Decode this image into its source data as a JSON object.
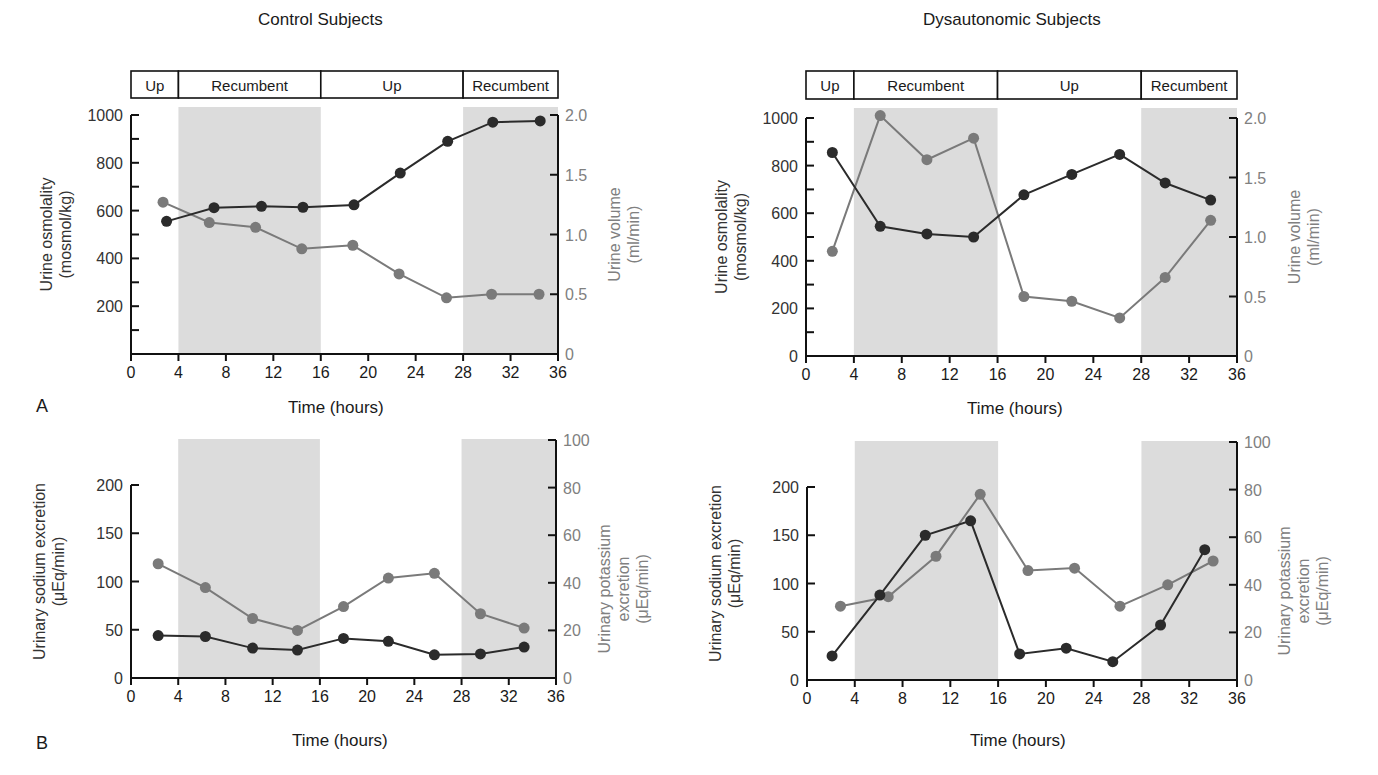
{
  "figure": {
    "panel_letters": [
      "A",
      "B"
    ],
    "column_titles": [
      "Control Subjects",
      "Dysautonomic Subjects"
    ],
    "posture_bar": [
      {
        "label": "Up",
        "from": 0,
        "to": 4
      },
      {
        "label": "Recumbent",
        "from": 4,
        "to": 16
      },
      {
        "label": "Up",
        "from": 16,
        "to": 28
      },
      {
        "label": "Recumbent",
        "from": 28,
        "to": 36
      }
    ],
    "shaded_intervals": [
      [
        4,
        16
      ],
      [
        28,
        36
      ]
    ],
    "colors": {
      "dark_series": "#2b2b2b",
      "gray_series": "#7a7a7a",
      "shade": "#dcdcdc",
      "axis": "#111111",
      "right_axis_text": "#808080"
    }
  },
  "chart_data": [
    {
      "id": "A-control",
      "type": "line",
      "title": "Control Subjects",
      "xlabel": "Time (hours)",
      "ylabel": "Urine osmolality (mosmol/kg)",
      "ylabel_right": "Urine volume (ml/min)",
      "xlim": [
        0,
        36
      ],
      "xticks": [
        0,
        4,
        8,
        12,
        16,
        20,
        24,
        28,
        32,
        36
      ],
      "ylim": [
        0,
        1000
      ],
      "yticks_labeled": [
        200,
        400,
        600,
        800,
        1000
      ],
      "yticks_minor": [
        100,
        300,
        500,
        700,
        900
      ],
      "ylim_right": [
        0,
        2.0
      ],
      "yticks_right": [
        "0",
        "0.5",
        "1.0",
        "1.5",
        "2.0"
      ],
      "grid": false,
      "series": [
        {
          "name": "Urine osmolality",
          "axis": "left",
          "color": "dark",
          "x": [
            3,
            7,
            11,
            14.5,
            18.8,
            22.7,
            26.7,
            30.5,
            34.5
          ],
          "values": [
            555,
            612,
            618,
            614,
            624,
            757,
            890,
            970,
            975
          ]
        },
        {
          "name": "Urine volume",
          "axis": "right",
          "color": "gray",
          "x": [
            2.7,
            6.6,
            10.5,
            14.4,
            18.7,
            22.6,
            26.6,
            30.4,
            34.4
          ],
          "values": [
            1.27,
            1.1,
            1.06,
            0.88,
            0.91,
            0.67,
            0.47,
            0.5,
            0.5
          ]
        }
      ]
    },
    {
      "id": "A-dysautonomic",
      "type": "line",
      "title": "Dysautonomic Subjects",
      "xlabel": "Time (hours)",
      "ylabel": "Urine osmolality (mosmol/kg)",
      "ylabel_right": "Urine volume (ml/min)",
      "xlim": [
        0,
        36
      ],
      "xticks": [
        0,
        4,
        8,
        12,
        16,
        20,
        24,
        28,
        32,
        36
      ],
      "ylim": [
        0,
        1000
      ],
      "yticks_labeled": [
        0,
        200,
        400,
        600,
        800,
        1000
      ],
      "yticks_minor": [
        100,
        300,
        500,
        700,
        900
      ],
      "ylim_right": [
        0,
        2.0
      ],
      "yticks_right": [
        "0",
        "0.5",
        "1.0",
        "1.5",
        "2.0"
      ],
      "grid": false,
      "series": [
        {
          "name": "Urine osmolality",
          "axis": "left",
          "color": "dark",
          "x": [
            2.2,
            6.2,
            10.1,
            14,
            18.2,
            22.2,
            26.2,
            30,
            33.8
          ],
          "values": [
            855,
            545,
            513,
            500,
            677,
            763,
            847,
            727,
            655
          ]
        },
        {
          "name": "Urine volume",
          "axis": "right",
          "color": "gray",
          "x": [
            2.2,
            6.2,
            10.1,
            14,
            18.2,
            22.2,
            26.2,
            30,
            33.8
          ],
          "values": [
            0.88,
            2.02,
            1.65,
            1.83,
            0.5,
            0.46,
            0.32,
            0.66,
            1.14
          ]
        }
      ]
    },
    {
      "id": "B-control",
      "type": "line",
      "xlabel": "Time (hours)",
      "ylabel": "Urinary sodium excretion (μEq/min)",
      "ylabel_right": "Urinary potassium excretion (μEq/min)",
      "xlim": [
        0,
        36
      ],
      "xticks": [
        0,
        4,
        8,
        12,
        16,
        20,
        24,
        28,
        32,
        36
      ],
      "ylim": [
        0,
        200
      ],
      "yticks_labeled": [
        0,
        50,
        100,
        150,
        200
      ],
      "ylim_right": [
        0,
        100
      ],
      "yticks_right": [
        "0",
        "20",
        "40",
        "60",
        "80",
        "100"
      ],
      "grid": false,
      "series": [
        {
          "name": "Urinary sodium excretion",
          "axis": "left",
          "color": "dark",
          "x": [
            2.3,
            6.3,
            10.3,
            14.1,
            18,
            21.8,
            25.7,
            29.6,
            33.3
          ],
          "values": [
            44,
            43,
            31,
            29,
            41,
            38,
            24,
            25,
            32
          ]
        },
        {
          "name": "Urinary potassium excretion",
          "axis": "right",
          "color": "gray",
          "x": [
            2.3,
            6.3,
            10.3,
            14.1,
            18,
            21.8,
            25.7,
            29.6,
            33.3
          ],
          "values": [
            48,
            38,
            25,
            20,
            30,
            42,
            44,
            27,
            21
          ]
        }
      ]
    },
    {
      "id": "B-dysautonomic",
      "type": "line",
      "xlabel": "Time (hours)",
      "ylabel": "Urinary sodium excretion (μEq/min)",
      "ylabel_right": "Urinary potassium excretion (μEq/min)",
      "xlim": [
        0,
        36
      ],
      "xticks": [
        0,
        4,
        8,
        12,
        16,
        20,
        24,
        28,
        32,
        36
      ],
      "ylim": [
        0,
        200
      ],
      "yticks_labeled": [
        0,
        50,
        100,
        150,
        200
      ],
      "ylim_right": [
        0,
        100
      ],
      "yticks_right": [
        "0",
        "20",
        "40",
        "60",
        "80",
        "100"
      ],
      "grid": false,
      "series": [
        {
          "name": "Urinary sodium excretion",
          "axis": "left",
          "color": "dark",
          "x": [
            2.1,
            6.1,
            9.9,
            13.7,
            17.8,
            21.7,
            25.6,
            29.6,
            33.3
          ],
          "values": [
            25,
            88,
            150,
            165,
            27,
            33,
            19,
            57,
            135
          ]
        },
        {
          "name": "Urinary potassium excretion",
          "axis": "right",
          "color": "gray",
          "x": [
            2.8,
            6.8,
            10.8,
            14.5,
            18.5,
            22.4,
            26.2,
            30.2,
            34
          ],
          "values": [
            31,
            35,
            52,
            78,
            46,
            47,
            31,
            40,
            50
          ]
        }
      ]
    }
  ]
}
